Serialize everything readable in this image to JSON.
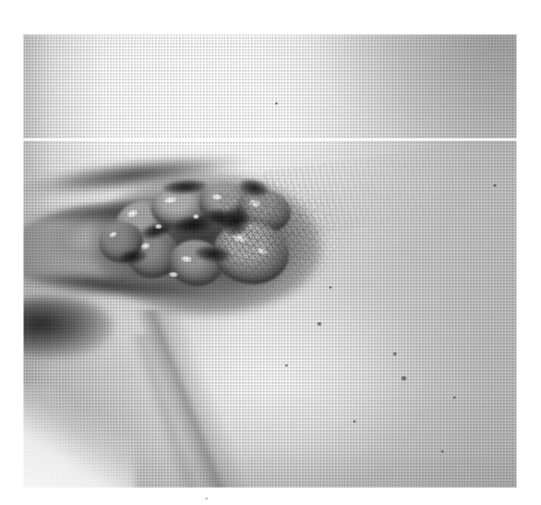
{
  "page": {
    "background_color": "#ffffff",
    "width": 541,
    "height": 505,
    "caption": ""
  },
  "figure": {
    "kind": "clinical-photograph",
    "media": "halftone-printed grayscale photograph, scanned",
    "plate": {
      "left": 23,
      "top": 34,
      "width": 494,
      "height": 454,
      "base_color": "#d9d9d9",
      "highlight_color": "#fdfdfd",
      "midtone_color": "#c9c9c9",
      "shadow_color": "#1e1e1e"
    },
    "artifact": {
      "name": "scanner-white-line",
      "description": "bright horizontal white line across the full width of the plate",
      "y_offset": 104,
      "thickness": 3,
      "color": "#ffffff"
    },
    "regions": [
      {
        "name": "upper-skin-field",
        "description": "broad over-exposed pale skin across the top of the frame",
        "tone": "very light"
      },
      {
        "name": "lesion-cluster",
        "description": "central-left cluster of lobulated, glistening nodular masses with deep dark fissures and bright specular highlights",
        "tone": "mid grey with white glints"
      },
      {
        "name": "labial-lobe",
        "description": "elongated rounded soft-tissue lobe extending from the lesion to the left edge",
        "tone": "light-mid grey"
      },
      {
        "name": "hair-field",
        "description": "fine dark hairs radiating up and to the right of the lesion",
        "tone": "dark stipple"
      },
      {
        "name": "inguinal-fold",
        "description": "long diagonal skin crease descending from upper-left to lower-centre",
        "tone": "soft grey line"
      },
      {
        "name": "thigh-surface",
        "description": "large pale illuminated skin surface occupying the right and lower portion",
        "tone": "light, fading to mid grey at right"
      }
    ],
    "lobes": [
      {
        "name": "lobe-1",
        "left": 92,
        "top": 166,
        "width": 58,
        "height": 44,
        "rotate": -14,
        "tone": "#a9a9a9"
      },
      {
        "name": "lobe-2",
        "left": 128,
        "top": 152,
        "width": 62,
        "height": 42,
        "rotate": -6,
        "tone": "#b4b4b4"
      },
      {
        "name": "lobe-3",
        "left": 176,
        "top": 150,
        "width": 56,
        "height": 40,
        "rotate": 4,
        "tone": "#a2a2a2"
      },
      {
        "name": "lobe-4",
        "left": 214,
        "top": 156,
        "width": 54,
        "height": 42,
        "rotate": 10,
        "tone": "#9b9b9b"
      },
      {
        "name": "lobe-5",
        "left": 104,
        "top": 196,
        "width": 52,
        "height": 48,
        "rotate": -8,
        "tone": "#8e8e8e"
      },
      {
        "name": "lobe-6",
        "left": 146,
        "top": 206,
        "width": 54,
        "height": 46,
        "rotate": 6,
        "tone": "#9a9a9a"
      },
      {
        "name": "lobe-7",
        "left": 190,
        "top": 188,
        "width": 76,
        "height": 62,
        "rotate": 8,
        "tone": "#b0b0b0"
      },
      {
        "name": "lobe-8",
        "left": 76,
        "top": 188,
        "width": 44,
        "height": 40,
        "rotate": -18,
        "tone": "#8a8a8a"
      }
    ],
    "glints": [
      {
        "left": 104,
        "top": 176,
        "width": 11,
        "height": 7,
        "rotate": -22
      },
      {
        "left": 141,
        "top": 163,
        "width": 13,
        "height": 6,
        "rotate": -8
      },
      {
        "left": 189,
        "top": 160,
        "width": 10,
        "height": 6,
        "rotate": 6
      },
      {
        "left": 226,
        "top": 166,
        "width": 12,
        "height": 7,
        "rotate": 16
      },
      {
        "left": 118,
        "top": 209,
        "width": 9,
        "height": 6,
        "rotate": -12
      },
      {
        "left": 158,
        "top": 222,
        "width": 11,
        "height": 6,
        "rotate": 8
      },
      {
        "left": 210,
        "top": 200,
        "width": 14,
        "height": 8,
        "rotate": 12
      },
      {
        "left": 234,
        "top": 214,
        "width": 10,
        "height": 6,
        "rotate": 20
      },
      {
        "left": 132,
        "top": 190,
        "width": 7,
        "height": 5,
        "rotate": 0
      },
      {
        "left": 170,
        "top": 180,
        "width": 6,
        "height": 5,
        "rotate": -4
      },
      {
        "left": 146,
        "top": 238,
        "width": 9,
        "height": 5,
        "rotate": 4
      },
      {
        "left": 86,
        "top": 198,
        "width": 8,
        "height": 5,
        "rotate": -26
      }
    ],
    "fissures": [
      {
        "left": 150,
        "top": 182,
        "width": 40,
        "height": 18,
        "rotate": -6
      },
      {
        "left": 182,
        "top": 176,
        "width": 34,
        "height": 16,
        "rotate": 12
      },
      {
        "left": 118,
        "top": 190,
        "width": 30,
        "height": 14,
        "rotate": -18
      },
      {
        "left": 172,
        "top": 212,
        "width": 36,
        "height": 16,
        "rotate": 6
      },
      {
        "left": 140,
        "top": 146,
        "width": 44,
        "height": 14,
        "rotate": -4
      },
      {
        "left": 200,
        "top": 172,
        "width": 26,
        "height": 30,
        "rotate": 22
      },
      {
        "left": 96,
        "top": 216,
        "width": 28,
        "height": 14,
        "rotate": -10
      },
      {
        "left": 216,
        "top": 146,
        "width": 30,
        "height": 16,
        "rotate": 14
      }
    ],
    "moles": [
      {
        "left": 294,
        "top": 288,
        "width": 5,
        "height": 4
      },
      {
        "left": 370,
        "top": 318,
        "width": 4,
        "height": 4
      },
      {
        "left": 378,
        "top": 342,
        "width": 6,
        "height": 5
      },
      {
        "left": 262,
        "top": 330,
        "width": 3,
        "height": 3
      },
      {
        "left": 418,
        "top": 416,
        "width": 3,
        "height": 3
      },
      {
        "left": 252,
        "top": 68,
        "width": 3,
        "height": 3
      },
      {
        "left": 470,
        "top": 150,
        "width": 4,
        "height": 3
      },
      {
        "left": 330,
        "top": 386,
        "width": 3,
        "height": 3
      },
      {
        "left": 306,
        "top": 252,
        "width": 3,
        "height": 3
      },
      {
        "left": 430,
        "top": 362,
        "width": 3,
        "height": 3
      }
    ],
    "page_speck": {
      "left": 205,
      "top": 497,
      "width": 3,
      "height": 3
    }
  }
}
